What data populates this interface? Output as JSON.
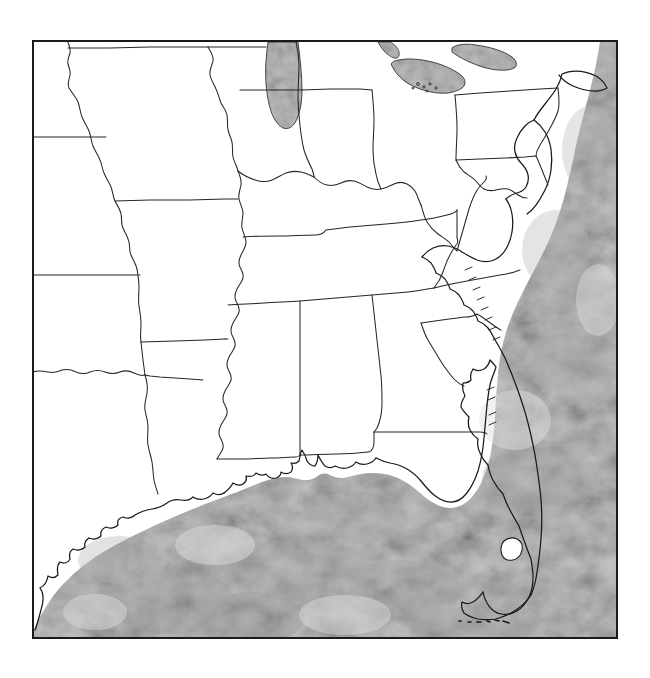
{
  "figure": {
    "kind": "outline-map",
    "title": "Blank outline map of the Southeastern United States",
    "caption": "",
    "width": 650,
    "height": 678,
    "background_color": "#ffffff"
  },
  "frame": {
    "name": "map-border",
    "x": 33,
    "y": 41,
    "width": 584,
    "height": 597,
    "stroke_color": "#1a1a1a",
    "stroke_width": 2,
    "fill_color": "#ffffff"
  },
  "style": {
    "land_fill": "#ffffff",
    "land_border_color": "#222222",
    "land_border_width": 1,
    "coastline_color": "#1a1a1a",
    "coastline_width": 1.3,
    "water_fill": "#c2c2c2",
    "water_fill_light": "#d6d6d6",
    "water_fill_dark": "#aeaeae",
    "lake_fill": "#bdbdbd",
    "lake_border_color": "#333333"
  },
  "legend": {
    "present": false,
    "entries": []
  },
  "labels": {
    "present": false,
    "items": []
  },
  "water_bodies": [
    {
      "name": "Gulf of Mexico",
      "label_shown": false,
      "region": "bottom-center"
    },
    {
      "name": "Atlantic Ocean",
      "label_shown": false,
      "region": "right"
    },
    {
      "name": "Lake Michigan",
      "label_shown": false,
      "region": "top-center"
    },
    {
      "name": "Lake Erie",
      "label_shown": false,
      "region": "top-right"
    },
    {
      "name": "Lake Ontario",
      "label_shown": false,
      "region": "top-right"
    },
    {
      "name": "Lake Okeechobee",
      "label_shown": false,
      "region": "florida-peninsula"
    },
    {
      "name": "Chesapeake Bay",
      "label_shown": false,
      "region": "mid-right"
    },
    {
      "name": "Florida Keys",
      "label_shown": false,
      "region": "bottom-right"
    }
  ],
  "regions_depicted": [
    {
      "name": "Nebraska",
      "label_shown": false
    },
    {
      "name": "Iowa",
      "label_shown": false
    },
    {
      "name": "Kansas",
      "label_shown": false
    },
    {
      "name": "Missouri",
      "label_shown": false
    },
    {
      "name": "Illinois",
      "label_shown": false
    },
    {
      "name": "Indiana",
      "label_shown": false
    },
    {
      "name": "Ohio",
      "label_shown": false
    },
    {
      "name": "Pennsylvania",
      "label_shown": false
    },
    {
      "name": "New Jersey",
      "label_shown": false
    },
    {
      "name": "Delaware",
      "label_shown": false
    },
    {
      "name": "Maryland",
      "label_shown": false
    },
    {
      "name": "West Virginia",
      "label_shown": false
    },
    {
      "name": "Virginia",
      "label_shown": false
    },
    {
      "name": "Kentucky",
      "label_shown": false
    },
    {
      "name": "Tennessee",
      "label_shown": false
    },
    {
      "name": "North Carolina",
      "label_shown": false
    },
    {
      "name": "South Carolina",
      "label_shown": false
    },
    {
      "name": "Georgia",
      "label_shown": false
    },
    {
      "name": "Alabama",
      "label_shown": false
    },
    {
      "name": "Mississippi",
      "label_shown": false
    },
    {
      "name": "Arkansas",
      "label_shown": false
    },
    {
      "name": "Louisiana",
      "label_shown": false
    },
    {
      "name": "Oklahoma",
      "label_shown": false
    },
    {
      "name": "Texas",
      "label_shown": false
    },
    {
      "name": "Florida",
      "label_shown": false
    }
  ],
  "geometry": {
    "ocean_mask": "M 33 638 L 617 638 L 617 41 L 600 41 L 596 60 L 592 84 L 588 104 L 584 122 L 578 140 L 572 160 L 568 186 L 565 210 L 562 232 L 556 250 L 548 268 L 540 286 L 530 304 L 520 322 L 512 342 L 506 364 L 502 388 L 500 412 L 498 436 L 494 456 L 488 472 L 480 486 L 470 498 L 458 508 L 446 514 L 434 512 L 424 504 L 418 492 L 412 480 L 404 472 L 392 468 L 378 466 L 360 466 L 340 468 L 322 470 L 304 472 L 286 474 L 268 478 L 252 484 L 236 492 L 220 500 L 204 508 L 188 516 L 172 524 L 156 532 L 140 540 L 124 548 L 108 556 L 92 566 L 76 578 L 62 592 L 50 608 L 40 624 L 33 638 Z",
    "gulf_coast": "M 33 628 L 40 612 L 48 600 L 54 588 L 58 576 L 62 566 L 68 558 L 74 552 L 80 548 L 86 544 L 92 540 L 100 534 L 110 528 L 120 522 L 130 516 L 142 510 L 154 504 L 166 498 L 178 494 L 190 490 L 202 488 L 212 486 L 220 482 L 228 478 L 236 474 L 244 470 L 252 468 L 260 468 L 268 470 L 274 472 L 280 472 L 286 470 L 292 466 L 298 462 L 302 458 L 306 462 L 310 466 L 314 468 L 320 468 L 326 466 L 334 464 L 344 462 L 354 462 L 364 464 L 374 466 L 384 468 L 394 470 L 404 472 L 412 476 L 420 482 L 428 488 L 436 494 L 444 498 L 452 500 L 460 498 L 468 494 L 476 488 L 482 480 L 488 470 L 492 458 L 494 444 L 496 428 L 498 412",
    "atlantic_coast": "M 600 41 L 597 56 L 594 72 L 590 88 L 586 104 L 582 118 L 578 132 L 574 146 L 570 162 L 566 180 L 562 198 L 558 216 L 554 234 L 548 250 L 540 266 L 532 282 L 524 298 L 516 314 L 510 330 L 506 348 L 502 366 L 500 384 L 498 402 L 498 420"
  }
}
